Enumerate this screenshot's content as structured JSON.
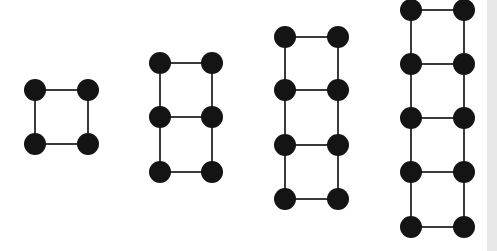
{
  "diagram": {
    "colors": {
      "node": "#141414",
      "edge": "#3a3a3a",
      "background": "#ffffff",
      "strip": "#e8e8e8"
    },
    "node_radius": 11,
    "figures": [
      {
        "squares": 1,
        "x": [
          35,
          88
        ],
        "y": [
          90,
          144
        ]
      },
      {
        "squares": 2,
        "x": [
          160,
          212
        ],
        "y": [
          63,
          117,
          172
        ]
      },
      {
        "squares": 3,
        "x": [
          285,
          338
        ],
        "y": [
          37,
          90,
          145,
          199
        ]
      },
      {
        "squares": 4,
        "x": [
          411,
          464
        ],
        "y": [
          10,
          64,
          118,
          172,
          227
        ]
      }
    ]
  }
}
